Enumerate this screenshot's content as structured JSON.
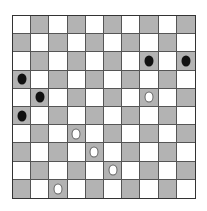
{
  "board": {
    "size": 10,
    "first_cell": "light",
    "colors": {
      "light": "#ffffff",
      "dark": "#b3b3b3",
      "black_piece": "#111111",
      "white_piece": "#ffffff"
    },
    "pieces": [
      {
        "row": 2,
        "col": 7,
        "color": "black"
      },
      {
        "row": 2,
        "col": 9,
        "color": "black"
      },
      {
        "row": 3,
        "col": 0,
        "color": "black"
      },
      {
        "row": 4,
        "col": 1,
        "color": "black"
      },
      {
        "row": 5,
        "col": 0,
        "color": "black"
      },
      {
        "row": 4,
        "col": 7,
        "color": "white"
      },
      {
        "row": 6,
        "col": 3,
        "color": "white"
      },
      {
        "row": 7,
        "col": 4,
        "color": "white"
      },
      {
        "row": 8,
        "col": 5,
        "color": "white"
      },
      {
        "row": 9,
        "col": 2,
        "color": "white"
      }
    ]
  }
}
